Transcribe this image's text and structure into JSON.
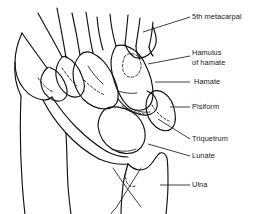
{
  "figure": {
    "background_color": "#ffffff",
    "line_color": "#111111",
    "text_color": "#171717"
  },
  "labels": {
    "metacarpal5": "5th metacarpal",
    "hamulus_line1": "Hamulus",
    "hamulus_line2": "of hamate",
    "hamate": "Hamate",
    "pisiform": "Pisiform",
    "triquetrum": "Triquetrum",
    "lunate": "Lunate",
    "ulna": "Ulna"
  },
  "structures": [
    {
      "name": "5th metacarpal",
      "leader": "diagonal-up-right"
    },
    {
      "name": "Hamulus of hamate",
      "leader": "diagonal-up-right"
    },
    {
      "name": "Hamate",
      "leader": "horizontal"
    },
    {
      "name": "Pisiform",
      "leader": "horizontal"
    },
    {
      "name": "Triquetrum",
      "leader": "diagonal-down-right"
    },
    {
      "name": "Lunate",
      "leader": "diagonal-down-right"
    },
    {
      "name": "Ulna",
      "leader": "horizontal"
    }
  ]
}
